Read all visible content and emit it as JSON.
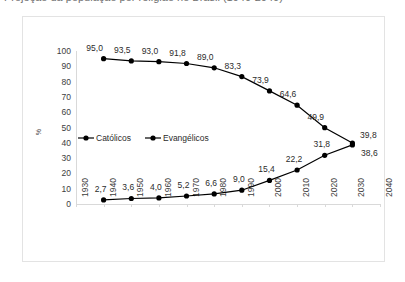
{
  "caption": {
    "text": "Projeção da população por religião no Brasil (1940-2040)"
  },
  "chart_data": {
    "type": "line",
    "title": "",
    "xlabel": "",
    "ylabel": "%",
    "x": [
      1930,
      1940,
      1950,
      1960,
      1970,
      1980,
      1990,
      2000,
      2010,
      2020,
      2030,
      2040
    ],
    "xticklabels": [
      "1930",
      "1940",
      "1950",
      "1960",
      "1970",
      "1980",
      "1990",
      "2000",
      "2010",
      "2020",
      "2030",
      "2040"
    ],
    "yticklabels": [
      "0",
      "10",
      "20",
      "30",
      "40",
      "50",
      "60",
      "70",
      "80",
      "90",
      "100"
    ],
    "ylim": [
      0,
      100
    ],
    "ytick_step": 10,
    "grid": false,
    "legend_position": "center-left",
    "series": [
      {
        "name": "Católicos",
        "color": "#000000",
        "marker": "circle",
        "x": [
          1940,
          1950,
          1960,
          1970,
          1980,
          1990,
          2000,
          2010,
          2020,
          2030
        ],
        "values": [
          95.0,
          93.5,
          93.0,
          91.8,
          89.0,
          83.3,
          73.9,
          64.6,
          49.9,
          39.8
        ],
        "labels": [
          "95,0",
          "93,5",
          "93,0",
          "91,8",
          "89,0",
          "83,3",
          "73,9",
          "64,6",
          "49,9",
          "39,8"
        ]
      },
      {
        "name": "Evangélicos",
        "color": "#000000",
        "marker": "circle",
        "x": [
          1940,
          1950,
          1960,
          1970,
          1980,
          1990,
          2000,
          2010,
          2020,
          2030
        ],
        "values": [
          2.7,
          3.6,
          4.0,
          5.2,
          6.6,
          9.0,
          15.4,
          22.2,
          31.8,
          38.6
        ],
        "labels": [
          "2,7",
          "3,6",
          "4,0",
          "5,2",
          "6,6",
          "9,0",
          "15,4",
          "22,2",
          "31,8",
          "38,6"
        ]
      }
    ]
  }
}
